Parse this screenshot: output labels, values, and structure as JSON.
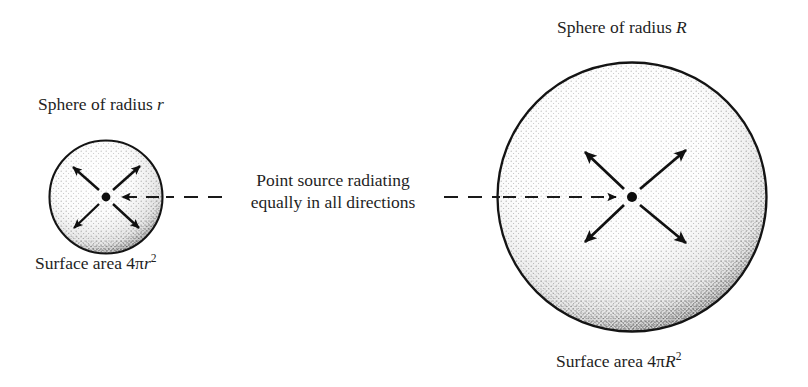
{
  "figure": {
    "background_color": "#ffffff",
    "ink_color": "#1a1a1a"
  },
  "small_sphere": {
    "title_prefix": "Sphere of radius ",
    "title_symbol": "r",
    "area_prefix": "Surface area 4",
    "area_pi": "π",
    "area_symbol": "r",
    "area_exponent": "2",
    "center_x": 106,
    "center_y": 197,
    "radius": 57,
    "arrow_count": 4,
    "arrow_directions": [
      "up-left",
      "up-right",
      "down-left",
      "down-right"
    ],
    "source_dot_label": "point-source"
  },
  "large_sphere": {
    "title_prefix": "Sphere of radius ",
    "title_symbol": "R",
    "area_prefix": "Surface area 4",
    "area_pi": "π",
    "area_symbol": "R",
    "area_exponent": "2",
    "center_x": 632,
    "center_y": 197,
    "radius": 135,
    "arrow_count": 4,
    "arrow_directions": [
      "up-left",
      "up-right",
      "down-left",
      "down-right"
    ],
    "source_dot_label": "point-source"
  },
  "center_caption": {
    "line1": "Point source radiating",
    "line2": "equally in all directions"
  },
  "connector": {
    "style": "dashed",
    "left_arrowhead": "points-left-into-small-sphere-center",
    "right_arrowhead": "points-right-into-large-sphere-center"
  }
}
